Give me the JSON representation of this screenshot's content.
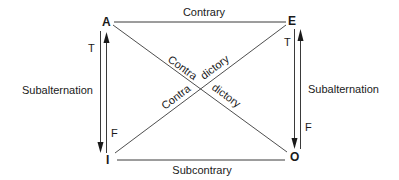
{
  "diagram": {
    "corners": {
      "A": "A",
      "E": "E",
      "I": "I",
      "O": "O"
    },
    "relations": {
      "top": "Contrary",
      "bottom": "Subcontrary",
      "left": "Subalternation",
      "right": "Subalternation",
      "diag_ao_upper": "Contra",
      "diag_ao_lower": "dictory",
      "diag_ie_upper": "dictory",
      "diag_ie_lower": "Contra"
    },
    "truth_labels": {
      "left_top": "T",
      "left_bottom": "F",
      "right_top": "T",
      "right_bottom": "F"
    },
    "colors": {
      "line": "#3a3a3a",
      "text": "#1a1a1a",
      "background": "#ffffff"
    }
  }
}
